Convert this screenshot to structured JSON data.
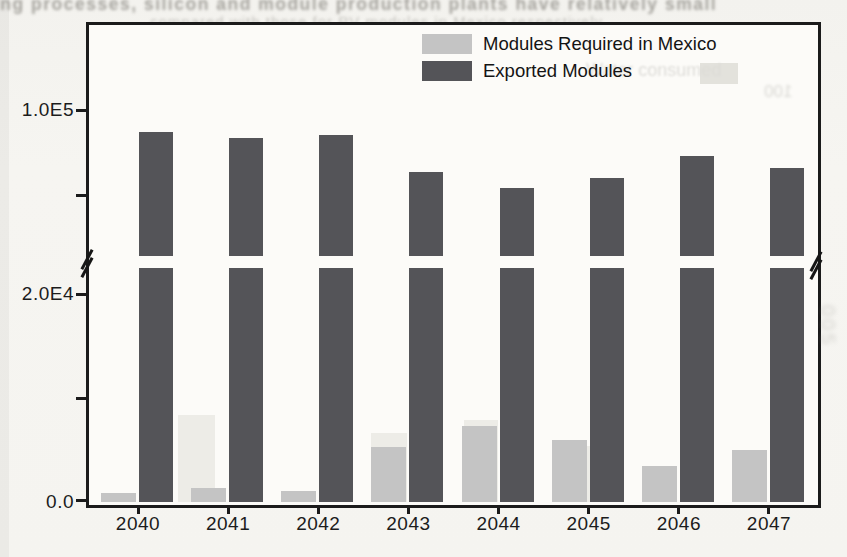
{
  "chart_data": {
    "type": "bar",
    "title": "",
    "xlabel": "",
    "ylabel": "",
    "categories": [
      "2040",
      "2041",
      "2042",
      "2043",
      "2044",
      "2045",
      "2046",
      "2047"
    ],
    "series": [
      {
        "name": "Modules Required in Mexico",
        "color": "#c4c4c4",
        "values": [
          850,
          1350,
          1050,
          5300,
          7300,
          6000,
          3500,
          5000
        ]
      },
      {
        "name": "Exported Modules",
        "color": "#545458",
        "values": [
          97400,
          96700,
          97100,
          92700,
          90800,
          92000,
          94600,
          93200
        ]
      }
    ],
    "y_axis": {
      "broken": true,
      "lower_range": [
        0,
        24000
      ],
      "upper_range": [
        83000,
        101500
      ],
      "lower_ticks": [
        {
          "value": 0,
          "label": "0.0"
        },
        {
          "value": 10000,
          "label": ""
        },
        {
          "value": 20000,
          "label": "2.0E4"
        }
      ],
      "upper_ticks": [
        {
          "value": 90000,
          "label": ""
        },
        {
          "value": 100000,
          "label": "1.0E5"
        }
      ]
    },
    "grid": false,
    "legend_position": "top-center-inside"
  },
  "scan_artifacts": {
    "top_text_line_1": "ing processes, silicon and module production plants have relatively small",
    "top_text_line_2": "compared with those for PV modules in Mexico respectively",
    "ghost_legend_label": "Water consumed",
    "ghost_number": "100",
    "side_ghost_text": "005",
    "ghost_bars": [
      {
        "x": 178,
        "top": 415,
        "width": 37
      },
      {
        "x": 371,
        "top": 433,
        "width": 36
      },
      {
        "x": 464,
        "top": 420,
        "width": 34
      },
      {
        "x": 557,
        "top": 446,
        "width": 33
      }
    ]
  }
}
